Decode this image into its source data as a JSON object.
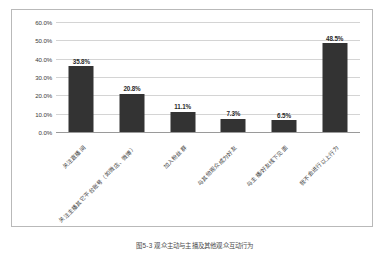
{
  "chart_data": {
    "type": "bar",
    "title": "",
    "subtitle": "",
    "xlabel": "",
    "ylabel": "",
    "categories": [
      "关注直播间",
      "关注主播其它平台账号（如微店、微博）",
      "加入粉丝群",
      "与其他观众成为好友",
      "与主播/好友线下见面",
      "我不会进行以上行为"
    ],
    "values": [
      35.8,
      20.8,
      11.1,
      7.3,
      6.5,
      48.5
    ],
    "value_labels": [
      "35.8%",
      "20.8%",
      "11.1%",
      "7.3%",
      "6.5%",
      "48.5%"
    ],
    "ylim": [
      0,
      60
    ],
    "ytick_values": [
      0,
      10,
      20,
      30,
      40,
      50,
      60
    ],
    "ytick_labels": [
      "0.0%",
      "10.0%",
      "20.0%",
      "30.0%",
      "40.0%",
      "50.0%",
      "60.0%"
    ],
    "grid": true,
    "legend": false,
    "legend_position": "none",
    "bar_color": "#333333",
    "gridline_color": "#d4d4d4",
    "axis_color": "#9a9a9a",
    "border_color": "#b9b9b9"
  },
  "caption": {
    "text": "图5-3 观众主动与主播及其他观众互动行为"
  }
}
